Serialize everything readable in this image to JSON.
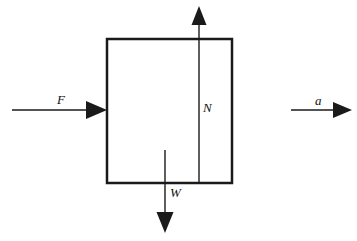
{
  "figure": {
    "type": "free-body-diagram",
    "background_color": "#ffffff",
    "stroke_color": "#1a1a1a",
    "canvas": {
      "width": 357,
      "height": 241
    }
  },
  "body": {
    "shape": "rectangle",
    "name": "block",
    "x": 107,
    "y": 39,
    "width": 125,
    "height": 144,
    "stroke_width": 2.5,
    "fill": "none"
  },
  "vectors": [
    {
      "id": "applied-force",
      "label": "F",
      "meaning": "applied force",
      "direction": "right",
      "line": {
        "x1": 12,
        "y1": 110,
        "x2": 107,
        "y2": 110
      },
      "tip": {
        "x": 107,
        "y": 110
      },
      "label_pos": {
        "x": 57,
        "y": 104
      },
      "stroke_width": 1.4
    },
    {
      "id": "normal-force",
      "label": "N",
      "meaning": "normal force",
      "direction": "up",
      "line": {
        "x1": 199,
        "y1": 183,
        "x2": 199,
        "y2": 6
      },
      "tip": {
        "x": 199,
        "y": 6
      },
      "label_pos": {
        "x": 203,
        "y": 112
      },
      "stroke_width": 1.4
    },
    {
      "id": "weight-force",
      "label": "W",
      "meaning": "weight",
      "direction": "down",
      "line": {
        "x1": 165,
        "y1": 150,
        "x2": 165,
        "y2": 233
      },
      "tip": {
        "x": 165,
        "y": 233
      },
      "label_pos": {
        "x": 170,
        "y": 197
      },
      "stroke_width": 1.4
    },
    {
      "id": "acceleration",
      "label": "a",
      "meaning": "acceleration",
      "direction": "right",
      "line": {
        "x1": 291,
        "y1": 110,
        "x2": 352,
        "y2": 110
      },
      "tip": {
        "x": 352,
        "y": 110
      },
      "label_pos": {
        "x": 315,
        "y": 105
      },
      "stroke_width": 1.4
    }
  ]
}
